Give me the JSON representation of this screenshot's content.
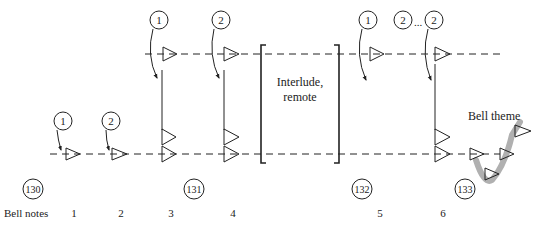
{
  "diagram": {
    "interlude_label_line1": "Interlude,",
    "interlude_label_line2": "remote",
    "bell_theme_label": "Bell theme",
    "bell_notes_label": "Bell notes",
    "ellipsis": "...",
    "bell_note_numbers": [
      "1",
      "2",
      "3",
      "4",
      "5",
      "6"
    ],
    "section_labels": [
      "130",
      "131",
      "132",
      "133"
    ],
    "step_markers": {
      "lower_1": "1",
      "lower_2": "2",
      "upper_1": "1",
      "upper_2": "2",
      "upper_r1": "1",
      "upper_r2a": "2",
      "upper_r2b": "2"
    },
    "colors": {
      "ink": "#222222",
      "theme_path": "#b0b0b0"
    }
  }
}
